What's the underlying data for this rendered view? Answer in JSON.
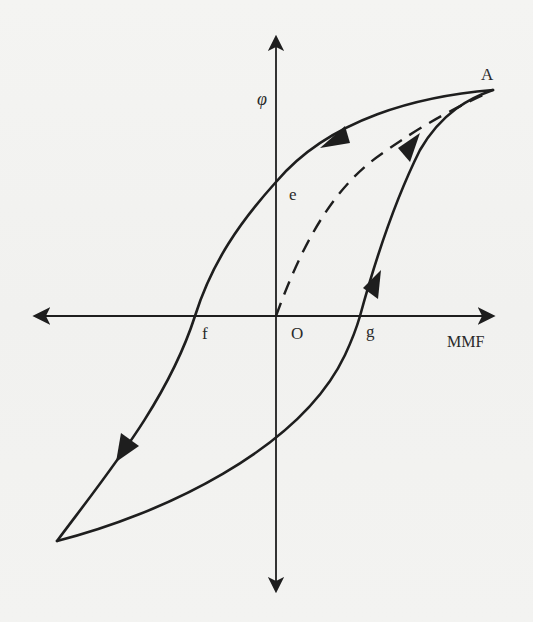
{
  "figure": {
    "axes": {
      "y_label": "φ",
      "x_label": "MMF",
      "origin_label": "O"
    },
    "points": {
      "A": "A",
      "e": "e",
      "f": "f",
      "g": "g"
    },
    "curves": [
      {
        "name": "descending-branch",
        "from": "A",
        "through": [
          "e",
          "f"
        ],
        "style": "solid",
        "direction": "A → e → f → lower-left tip"
      },
      {
        "name": "ascending-branch",
        "from": "lower-left tip",
        "through": [
          "g"
        ],
        "to": "A",
        "style": "solid",
        "direction": "lower-left tip → g → A"
      },
      {
        "name": "initial-magnetization-curve",
        "from": "O",
        "to": "A",
        "style": "dashed",
        "direction": "O → A"
      }
    ],
    "colors": {
      "ink": "#1e1e1e",
      "background": "#f3f3f1"
    }
  }
}
